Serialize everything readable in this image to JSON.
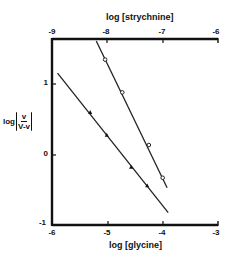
{
  "chart_data": {
    "type": "line",
    "title": "",
    "ylabel": "log [v / (V - v)]",
    "ylabel_parts": {
      "prefix": "log",
      "numerator": "v",
      "denominator": "V-v"
    },
    "ylim": [
      -1,
      1.5
    ],
    "yticks": [
      -1,
      0,
      1
    ],
    "grid": false,
    "legend": null,
    "axes": {
      "bottom": {
        "label": "log [glycine]",
        "range": [
          -6,
          -3
        ],
        "ticks": [
          -6,
          -5,
          -4,
          -3
        ]
      },
      "top": {
        "label": "log [strychnine]",
        "range": [
          -9,
          -6
        ],
        "ticks": [
          -9,
          -8,
          -7,
          -6
        ]
      }
    },
    "series": [
      {
        "name": "strychnine",
        "axis": "top",
        "marker": "open-circle",
        "x": [
          -8.04,
          -7.73,
          -7.25,
          -7.0
        ],
        "y": [
          1.34,
          0.88,
          0.14,
          -0.32
        ],
        "fit_line": {
          "x": [
            -8.2,
            -6.92
          ],
          "y": [
            1.6,
            -0.46
          ]
        }
      },
      {
        "name": "glycine",
        "axis": "bottom",
        "marker": "filled-triangle",
        "x": [
          -5.31,
          -5.01,
          -4.57,
          -4.28
        ],
        "y": [
          0.6,
          0.28,
          -0.17,
          -0.43
        ],
        "fit_line": {
          "x": [
            -5.9,
            -3.9
          ],
          "y": [
            1.15,
            -0.81
          ]
        }
      }
    ]
  },
  "labels": {
    "top_axis": "log [strychnine]",
    "bottom_axis": "log [glycine]",
    "y_prefix": "log",
    "y_num": "v",
    "y_den": "V-v",
    "top_ticks": [
      "-9",
      "-8",
      "-7",
      "-6"
    ],
    "bottom_ticks": [
      "-6",
      "-5",
      "-4",
      "-3"
    ],
    "y_ticks": [
      "1",
      "0",
      "-1"
    ]
  }
}
